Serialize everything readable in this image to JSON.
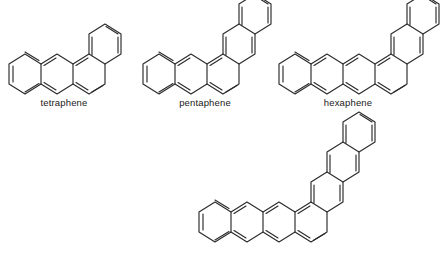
{
  "figure": {
    "background_color": "#ffffff",
    "stroke_color": "#2b2b2b",
    "label_color": "#1a1a1a"
  },
  "structures": [
    {
      "id": "tetraphene",
      "label": "tetraphene",
      "ring_count": 4,
      "linear_rings": 3,
      "angular_rings": 1,
      "formula": "C18H12",
      "shape": "angular acene"
    },
    {
      "id": "pentaphene",
      "label": "pentaphene",
      "ring_count": 5,
      "linear_rings": 3,
      "angular_rings": 2,
      "formula": "C22H14",
      "shape": "angular acene"
    },
    {
      "id": "hexaphene",
      "label": "hexaphene",
      "ring_count": 6,
      "linear_rings": 4,
      "angular_rings": 2,
      "formula": "C26H16",
      "shape": "angular acene"
    },
    {
      "id": "heptaphene",
      "label": "",
      "ring_count": 7,
      "linear_rings": 4,
      "angular_rings": 3,
      "formula": "C30H18",
      "shape": "angular acene"
    }
  ]
}
